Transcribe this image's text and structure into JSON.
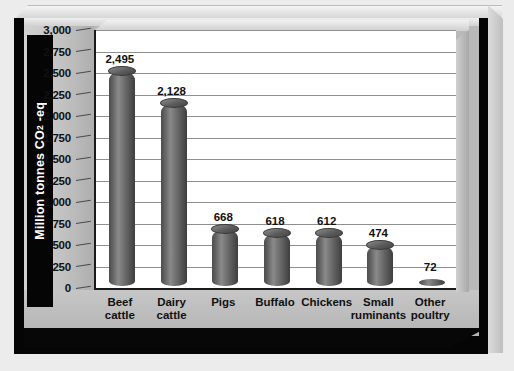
{
  "chart": {
    "type": "bar",
    "ylabel_text": "Million tonnes CO",
    "ylabel_sub": "2",
    "ylabel_tail": " -eq"
  },
  "chart_data": {
    "type": "bar",
    "title": "",
    "xlabel": "",
    "ylabel": "Million tonnes CO2 -eq",
    "ylim": [
      0,
      3000
    ],
    "ytick_labels": [
      "3,000",
      "2,750",
      "2,500",
      "2,250",
      "2,000",
      "1,750",
      "1,500",
      "1,250",
      "1,000",
      "750",
      "500",
      "250",
      "0"
    ],
    "ytick_values": [
      3000,
      2750,
      2500,
      2250,
      2000,
      1750,
      1500,
      1250,
      1000,
      750,
      500,
      250,
      0
    ],
    "grid": true,
    "legend": "none",
    "categories": [
      "Beef cattle",
      "Dairy cattle",
      "Pigs",
      "Buffalo",
      "Chickens",
      "Small ruminants",
      "Other poultry"
    ],
    "category_lines": [
      [
        "Beef",
        "cattle"
      ],
      [
        "Dairy",
        "cattle"
      ],
      [
        "Pigs",
        ""
      ],
      [
        "Buffalo",
        ""
      ],
      [
        "Chickens",
        ""
      ],
      [
        "Small",
        "ruminants"
      ],
      [
        "Other",
        "poultry"
      ]
    ],
    "values": [
      2495,
      2128,
      668,
      618,
      612,
      474,
      72
    ],
    "value_labels": [
      "2,495",
      "2,128",
      "668",
      "618",
      "612",
      "474",
      "72"
    ]
  },
  "colors": {
    "frame": "#050505",
    "plate": "#b9b9b9",
    "plot_bg": "#ffffff",
    "gridline": "#8f8f8f",
    "bar_dark": "#3e3e3e",
    "bar_light": "#8a8a8a",
    "axis_title_text": "#ffffff",
    "page_bg": "#e9e9e9"
  }
}
